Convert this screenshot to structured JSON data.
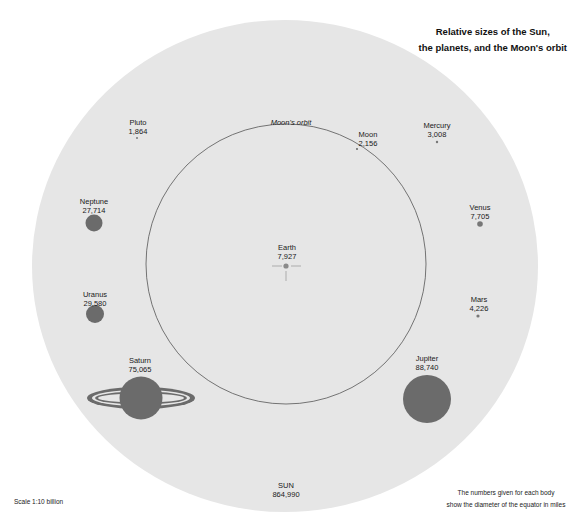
{
  "title": {
    "line1": "Relative sizes of the Sun,",
    "line2": "the planets, and the Moon's orbit"
  },
  "scale": "Scale 1:10 billion",
  "note": {
    "line1": "The numbers given for each body",
    "line2": "show the diameter of the equator in miles"
  },
  "orbit_label": "Moon's orbit",
  "colors": {
    "sun": "#e6e6e6",
    "planet": "#6b6b6b",
    "orbit": "#555555",
    "background": "#ffffff"
  },
  "bodies": {
    "sun": {
      "name": "SUN",
      "diameter": "864,990"
    },
    "earth": {
      "name": "Earth",
      "diameter": "7,927"
    },
    "moon": {
      "name": "Moon",
      "diameter": "2,156"
    },
    "mercury": {
      "name": "Mercury",
      "diameter": "3,008"
    },
    "venus": {
      "name": "Venus",
      "diameter": "7,705"
    },
    "mars": {
      "name": "Mars",
      "diameter": "4,226"
    },
    "jupiter": {
      "name": "Jupiter",
      "diameter": "88,740"
    },
    "saturn": {
      "name": "Saturn",
      "diameter": "75,065"
    },
    "uranus": {
      "name": "Uranus",
      "diameter": "29,580"
    },
    "neptune": {
      "name": "Neptune",
      "diameter": "27,714"
    },
    "pluto": {
      "name": "Pluto",
      "diameter": "1,864"
    }
  }
}
